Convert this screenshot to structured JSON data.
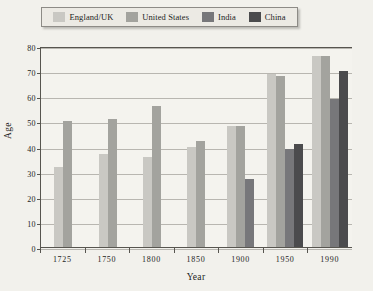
{
  "legend": {
    "position": "top",
    "items": [
      {
        "label": "England/UK",
        "color": "#c9c8c3"
      },
      {
        "label": "United States",
        "color": "#a3a39e"
      },
      {
        "label": "India",
        "color": "#77777a"
      },
      {
        "label": "China",
        "color": "#4b4b4d"
      }
    ]
  },
  "chart_data": {
    "type": "bar",
    "title": "",
    "xlabel": "Year",
    "ylabel": "Age",
    "categories": [
      "1725",
      "1750",
      "1800",
      "1850",
      "1900",
      "1950",
      "1990"
    ],
    "ylim": [
      0,
      80
    ],
    "yticks": [
      0,
      10,
      20,
      30,
      40,
      50,
      60,
      70,
      80
    ],
    "ytick_labels": [
      "0",
      "10",
      "20",
      "30",
      "40",
      "50",
      "60",
      "70",
      "80"
    ],
    "grid": true,
    "series": [
      {
        "name": "England/UK",
        "color": "#c9c8c3",
        "values": [
          32,
          37,
          36,
          40,
          48,
          69,
          76
        ]
      },
      {
        "name": "United States",
        "color": "#a3a39e",
        "values": [
          50,
          51,
          56,
          42,
          48,
          68,
          76
        ]
      },
      {
        "name": "India",
        "color": "#77777a",
        "values": [
          null,
          null,
          null,
          null,
          27,
          39,
          59
        ]
      },
      {
        "name": "China",
        "color": "#4b4b4d",
        "values": [
          null,
          null,
          null,
          null,
          null,
          41,
          70
        ]
      }
    ]
  }
}
